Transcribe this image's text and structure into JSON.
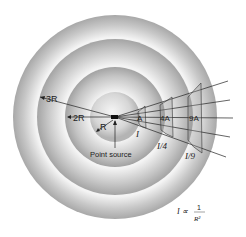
{
  "diagram": {
    "labels": {
      "radius_3r": "3R",
      "radius_2r": "2R",
      "radius_r": "R",
      "point_source": "Point source",
      "area_1": "A",
      "area_4": "4A",
      "area_9": "9A",
      "intensity_1": "I",
      "intensity_4": "I/4",
      "intensity_9": "I/9"
    },
    "formula": {
      "lhs": "I ∝",
      "numerator": "1",
      "denominator": "R²"
    },
    "colors": {
      "ring_dark": "#9a9a9a",
      "ring_light": "#f2f2f2",
      "line": "#222222"
    }
  }
}
